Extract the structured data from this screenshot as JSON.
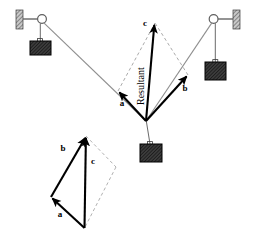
{
  "figure": {
    "width": 254,
    "height": 239,
    "background_color": "#ffffff"
  },
  "colors": {
    "vector_stroke": "#000000",
    "rope_stroke": "#8a8a8a",
    "dashed_stroke": "#9a9a9a",
    "weight_fill": "#4a4a4a",
    "weight_stroke": "#000000",
    "wall_fill": "#b0b0b0",
    "wall_stroke": "#000000",
    "pulley_fill": "#ffffff",
    "pulley_stroke": "#555555",
    "label_color": "#000000"
  },
  "labels": {
    "vector_a_main": "a",
    "vector_b_main": "b",
    "vector_c_main": "c",
    "resultant": "Resultant",
    "vector_a_inset": "a",
    "vector_b_inset": "b",
    "vector_c_inset": "c"
  },
  "main_diagram": {
    "knot": {
      "x": 146,
      "y": 121
    },
    "vectors": [
      {
        "name": "a",
        "label": "a",
        "from": {
          "x": 146,
          "y": 121
        },
        "to": {
          "x": 118,
          "y": 91
        },
        "label_pos": {
          "x": 122,
          "y": 103
        },
        "style": "solid-arrow"
      },
      {
        "name": "b",
        "label": "b",
        "from": {
          "x": 146,
          "y": 121
        },
        "to": {
          "x": 188,
          "y": 75
        },
        "label_pos": {
          "x": 184,
          "y": 88
        },
        "style": "solid-arrow"
      },
      {
        "name": "c",
        "label": "c",
        "from": {
          "x": 146,
          "y": 121
        },
        "to": {
          "x": 155,
          "y": 23
        },
        "label_pos": {
          "x": 145,
          "y": 26
        },
        "style": "solid-arrow",
        "annotation": "Resultant"
      }
    ],
    "construction_lines": [
      {
        "from": {
          "x": 118,
          "y": 91
        },
        "to": {
          "x": 155,
          "y": 23
        },
        "style": "dashed"
      },
      {
        "from": {
          "x": 188,
          "y": 75
        },
        "to": {
          "x": 155,
          "y": 23
        },
        "style": "dashed"
      }
    ],
    "resultant_label_pos": {
      "x": 139,
      "y": 93
    },
    "resultant_label_rotation": -90
  },
  "inset_diagram": {
    "origin": {
      "x": 84,
      "y": 228
    },
    "vectors": [
      {
        "name": "a",
        "label": "a",
        "from": {
          "x": 84,
          "y": 228
        },
        "to": {
          "x": 51,
          "y": 197
        },
        "label_pos": {
          "x": 59,
          "y": 214
        },
        "style": "solid-arrow"
      },
      {
        "name": "b",
        "label": "b",
        "from": {
          "x": 51,
          "y": 197
        },
        "to": {
          "x": 86,
          "y": 136
        },
        "label_pos": {
          "x": 64,
          "y": 148
        },
        "style": "solid-arrow"
      },
      {
        "name": "c",
        "label": "c",
        "from": {
          "x": 84,
          "y": 228
        },
        "to": {
          "x": 86,
          "y": 136
        },
        "label_pos": {
          "x": 91,
          "y": 161
        },
        "style": "solid-arrow"
      }
    ],
    "construction_lines": [
      {
        "from": {
          "x": 86,
          "y": 136
        },
        "to": {
          "x": 116,
          "y": 167
        },
        "style": "dashed"
      },
      {
        "from": {
          "x": 116,
          "y": 167
        },
        "to": {
          "x": 84,
          "y": 228
        },
        "style": "dashed"
      }
    ]
  },
  "pulleys": [
    {
      "name": "left-pulley",
      "center": {
        "x": 42,
        "y": 19
      },
      "radius": 4.5,
      "wall": {
        "x": 16,
        "y": 10,
        "width": 7,
        "height": 19
      },
      "rod": {
        "from": {
          "x": 23,
          "y": 19
        },
        "to": {
          "x": 38,
          "y": 19
        }
      },
      "hanger_string": {
        "from": {
          "x": 40,
          "y": 23
        },
        "to": {
          "x": 40,
          "y": 41
        }
      },
      "weight": {
        "x": 30,
        "y": 41,
        "width": 21,
        "height": 14
      }
    },
    {
      "name": "right-pulley",
      "center": {
        "x": 214,
        "y": 19
      },
      "radius": 4.5,
      "wall": {
        "x": 233,
        "y": 10,
        "width": 7,
        "height": 19
      },
      "rod": {
        "from": {
          "x": 218,
          "y": 19
        },
        "to": {
          "x": 233,
          "y": 19
        }
      },
      "hanger_string": {
        "from": {
          "x": 215,
          "y": 23
        },
        "to": {
          "x": 215,
          "y": 62
        }
      },
      "weight": {
        "x": 205,
        "y": 62,
        "width": 21,
        "height": 18
      }
    }
  ],
  "center_weight": {
    "name": "center-weight",
    "string": {
      "from": {
        "x": 146,
        "y": 121
      },
      "to": {
        "x": 150,
        "y": 144
      }
    },
    "block": {
      "x": 140,
      "y": 144,
      "width": 22,
      "height": 18
    }
  },
  "ropes": [
    {
      "name": "left-rope",
      "from": {
        "x": 42,
        "y": 23
      },
      "to": {
        "x": 146,
        "y": 121
      }
    },
    {
      "name": "right-rope",
      "from": {
        "x": 146,
        "y": 121
      },
      "to": {
        "x": 214,
        "y": 23
      }
    }
  ]
}
